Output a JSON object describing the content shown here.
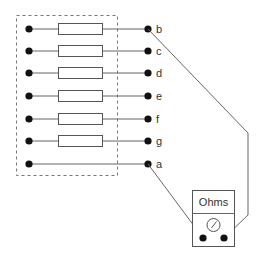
{
  "diagram": {
    "title": "",
    "enclosure": {
      "style": "dashed",
      "label": ""
    },
    "rows": [
      {
        "terminal_label": "b",
        "has_resistor": true,
        "y": 29
      },
      {
        "terminal_label": "c",
        "has_resistor": true,
        "y": 51
      },
      {
        "terminal_label": "d",
        "has_resistor": true,
        "y": 73
      },
      {
        "terminal_label": "e",
        "has_resistor": true,
        "y": 96
      },
      {
        "terminal_label": "f",
        "has_resistor": true,
        "y": 119
      },
      {
        "terminal_label": "g",
        "has_resistor": true,
        "y": 141
      },
      {
        "terminal_label": "a",
        "has_resistor": false,
        "y": 164
      }
    ],
    "meter": {
      "label": "Ohms",
      "icon": "dial-gauge-icon",
      "probe_connections": [
        "a",
        "b"
      ]
    },
    "colors": {
      "wire": "#666666",
      "dot": "#111111",
      "text": "#333333"
    }
  }
}
